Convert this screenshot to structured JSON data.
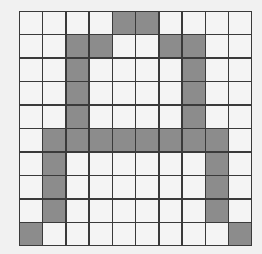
{
  "grid": {
    "rows": 10,
    "cols": 10,
    "filled_color": "#8c8c8c",
    "empty_color": "#f4f4f4",
    "line_color": "#3a3a3a",
    "pattern": [
      "0000110000",
      "0011001100",
      "0010000100",
      "0010000100",
      "0010000100",
      "0111111110",
      "0100000010",
      "0100000010",
      "0100000010",
      "1000000001"
    ]
  }
}
